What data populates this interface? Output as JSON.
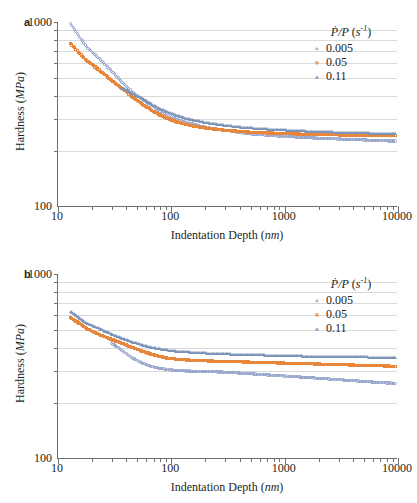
{
  "figure": {
    "panels": [
      {
        "label": "a",
        "axis": {
          "x_title_main": "Indentation Depth (",
          "x_title_unit": "nm",
          "x_title_close": ")",
          "y_title_main": "Hardness (",
          "y_title_unit": "MPa",
          "y_title_close": ")",
          "x_ticks": [
            "10",
            "100",
            "1000",
            "10000"
          ],
          "y_ticks": [
            "1000",
            "100"
          ]
        },
        "legend": {
          "title_num": "P",
          "title_den": "P",
          "title_unit": "s",
          "title_exp": "-1",
          "entries": [
            {
              "label": "0.005",
              "marker": "circle",
              "color": "#8d9dc8"
            },
            {
              "label": "0.05",
              "marker": "square",
              "color": "#e8873b"
            },
            {
              "label": "0.11",
              "marker": "triangle",
              "color": "#7d94b8"
            }
          ]
        }
      },
      {
        "label": "b",
        "axis": {
          "x_title_main": "Indentation Depth (",
          "x_title_unit": "nm",
          "x_title_close": ")",
          "y_title_main": "Hardness (",
          "y_title_unit": "MPa",
          "y_title_close": ")",
          "x_ticks": [
            "10",
            "100",
            "1000",
            "10000"
          ],
          "y_ticks": [
            "1000",
            "100"
          ]
        },
        "legend": {
          "title_num": "P",
          "title_den": "P",
          "title_unit": "s",
          "title_exp": "-1",
          "entries": [
            {
              "label": "0.005",
              "marker": "circle",
              "color": "#8d9dc8"
            },
            {
              "label": "0.05",
              "marker": "square",
              "color": "#e8873b"
            },
            {
              "label": "0.11",
              "marker": "triangle",
              "color": "#7d94b8"
            }
          ]
        }
      }
    ]
  },
  "chart_data": [
    {
      "type": "scatter",
      "panel": "a",
      "title": "",
      "xlabel": "Indentation Depth (nm)",
      "ylabel": "Hardness (MPa)",
      "xscale": "log",
      "yscale": "log",
      "xlim": [
        10,
        10000
      ],
      "ylim": [
        100,
        1000
      ],
      "xticks": [
        10,
        100,
        1000,
        10000
      ],
      "yticks": [
        100,
        1000
      ],
      "ygridlines": [
        200,
        300,
        400,
        500,
        600,
        700,
        800,
        900
      ],
      "grid": true,
      "legend_position": "top-right",
      "legend_title": "Ṗ/P (s⁻¹)",
      "series": [
        {
          "name": "0.005",
          "marker": "circle",
          "color": "#8d9dc8",
          "x": [
            13,
            18,
            24,
            30,
            37,
            45,
            55,
            66,
            78,
            92,
            110,
            130,
            155,
            185,
            220,
            260,
            310,
            370,
            440,
            520,
            620,
            740,
            880,
            1050,
            1250,
            1500,
            1800,
            2150,
            2550,
            3050,
            3650,
            4350,
            5200,
            6200,
            7400,
            8800,
            9500
          ],
          "y": [
            975,
            730,
            620,
            540,
            470,
            420,
            385,
            355,
            330,
            312,
            298,
            288,
            280,
            272,
            266,
            262,
            258,
            254,
            250,
            247,
            245,
            243,
            241,
            239,
            238,
            236,
            235,
            234,
            233,
            232,
            231,
            230,
            229,
            228,
            227,
            226,
            226
          ]
        },
        {
          "name": "0.05",
          "marker": "square",
          "color": "#e8873b",
          "x": [
            13,
            18,
            24,
            30,
            37,
            45,
            55,
            66,
            78,
            92,
            110,
            130,
            155,
            185,
            220,
            260,
            310,
            370,
            440,
            520,
            620,
            740,
            880,
            1050,
            1250,
            1500,
            1800,
            2150,
            2550,
            3050,
            3650,
            4350,
            5200,
            6200,
            7400,
            8800,
            9500
          ],
          "y": [
            760,
            615,
            540,
            480,
            435,
            395,
            360,
            335,
            315,
            300,
            288,
            280,
            273,
            268,
            264,
            261,
            258,
            256,
            254,
            252,
            251,
            250,
            249,
            248,
            247,
            246,
            246,
            245,
            245,
            244,
            244,
            243,
            243,
            243,
            242,
            242,
            242
          ]
        },
        {
          "name": "0.11",
          "marker": "triangle",
          "color": "#7d94b8",
          "x": [
            37,
            45,
            55,
            66,
            78,
            92,
            110,
            130,
            155,
            185,
            220,
            260,
            310,
            370,
            440,
            520,
            620,
            740,
            880,
            1050,
            1250,
            1500,
            1800,
            2150,
            2550,
            3050,
            3650,
            4350,
            5200,
            6200,
            7400,
            8800,
            9500
          ],
          "y": [
            440,
            410,
            385,
            360,
            340,
            325,
            312,
            302,
            294,
            288,
            282,
            278,
            274,
            271,
            268,
            266,
            264,
            262,
            260,
            259,
            257,
            256,
            255,
            254,
            253,
            252,
            251,
            251,
            250,
            249,
            249,
            248,
            248
          ]
        }
      ]
    },
    {
      "type": "scatter",
      "panel": "b",
      "title": "",
      "xlabel": "Indentation Depth (nm)",
      "ylabel": "Hardness (MPa)",
      "xscale": "log",
      "yscale": "log",
      "xlim": [
        10,
        10000
      ],
      "ylim": [
        100,
        1000
      ],
      "xticks": [
        10,
        100,
        1000,
        10000
      ],
      "yticks": [
        100,
        1000
      ],
      "ygridlines": [
        200,
        300,
        400,
        500,
        600,
        700,
        800,
        900
      ],
      "grid": true,
      "legend_position": "top-right",
      "legend_title": "Ṗ/P (s⁻¹)",
      "series": [
        {
          "name": "0.005",
          "marker": "circle",
          "color": "#8d9dc8",
          "x": [
            30,
            37,
            45,
            55,
            66,
            78,
            92,
            110,
            130,
            155,
            185,
            220,
            260,
            310,
            370,
            440,
            520,
            620,
            740,
            880,
            1050,
            1250,
            1500,
            1800,
            2150,
            2550,
            3050,
            3650,
            4350,
            5200,
            6200,
            7400,
            8800,
            9500
          ],
          "y": [
            420,
            385,
            352,
            330,
            316,
            308,
            303,
            300,
            298,
            297,
            296,
            295,
            294,
            293,
            291,
            289,
            287,
            285,
            283,
            281,
            279,
            277,
            275,
            273,
            271,
            269,
            267,
            265,
            263,
            261,
            259,
            257,
            256,
            255
          ]
        },
        {
          "name": "0.05",
          "marker": "square",
          "color": "#e8873b",
          "x": [
            13,
            18,
            24,
            30,
            37,
            45,
            55,
            66,
            78,
            92,
            110,
            130,
            155,
            185,
            220,
            260,
            310,
            370,
            440,
            520,
            620,
            740,
            880,
            1050,
            1250,
            1500,
            1800,
            2150,
            2550,
            3050,
            3650,
            4350,
            5200,
            6200,
            7400,
            8800,
            9500
          ],
          "y": [
            580,
            505,
            465,
            440,
            420,
            400,
            382,
            368,
            358,
            350,
            345,
            342,
            340,
            338,
            337,
            336,
            335,
            334,
            333,
            332,
            331,
            330,
            329,
            328,
            327,
            326,
            325,
            324,
            323,
            322,
            321,
            320,
            319,
            318,
            317,
            316,
            315
          ]
        },
        {
          "name": "0.11",
          "marker": "triangle",
          "color": "#7d94b8",
          "x": [
            13,
            18,
            24,
            30,
            37,
            45,
            55,
            66,
            78,
            92,
            110,
            130,
            155,
            185,
            220,
            260,
            310,
            370,
            440,
            520,
            620,
            740,
            880,
            1050,
            1250,
            1500,
            1800,
            2150,
            2550,
            3050,
            3650,
            4350,
            5200,
            6200,
            7400,
            8800,
            9500
          ],
          "y": [
            620,
            540,
            500,
            470,
            448,
            428,
            412,
            400,
            392,
            386,
            381,
            378,
            375,
            373,
            371,
            369,
            368,
            366,
            365,
            364,
            363,
            362,
            361,
            360,
            359,
            358,
            357,
            357,
            356,
            355,
            355,
            354,
            354,
            353,
            353,
            352,
            352
          ]
        }
      ]
    }
  ]
}
